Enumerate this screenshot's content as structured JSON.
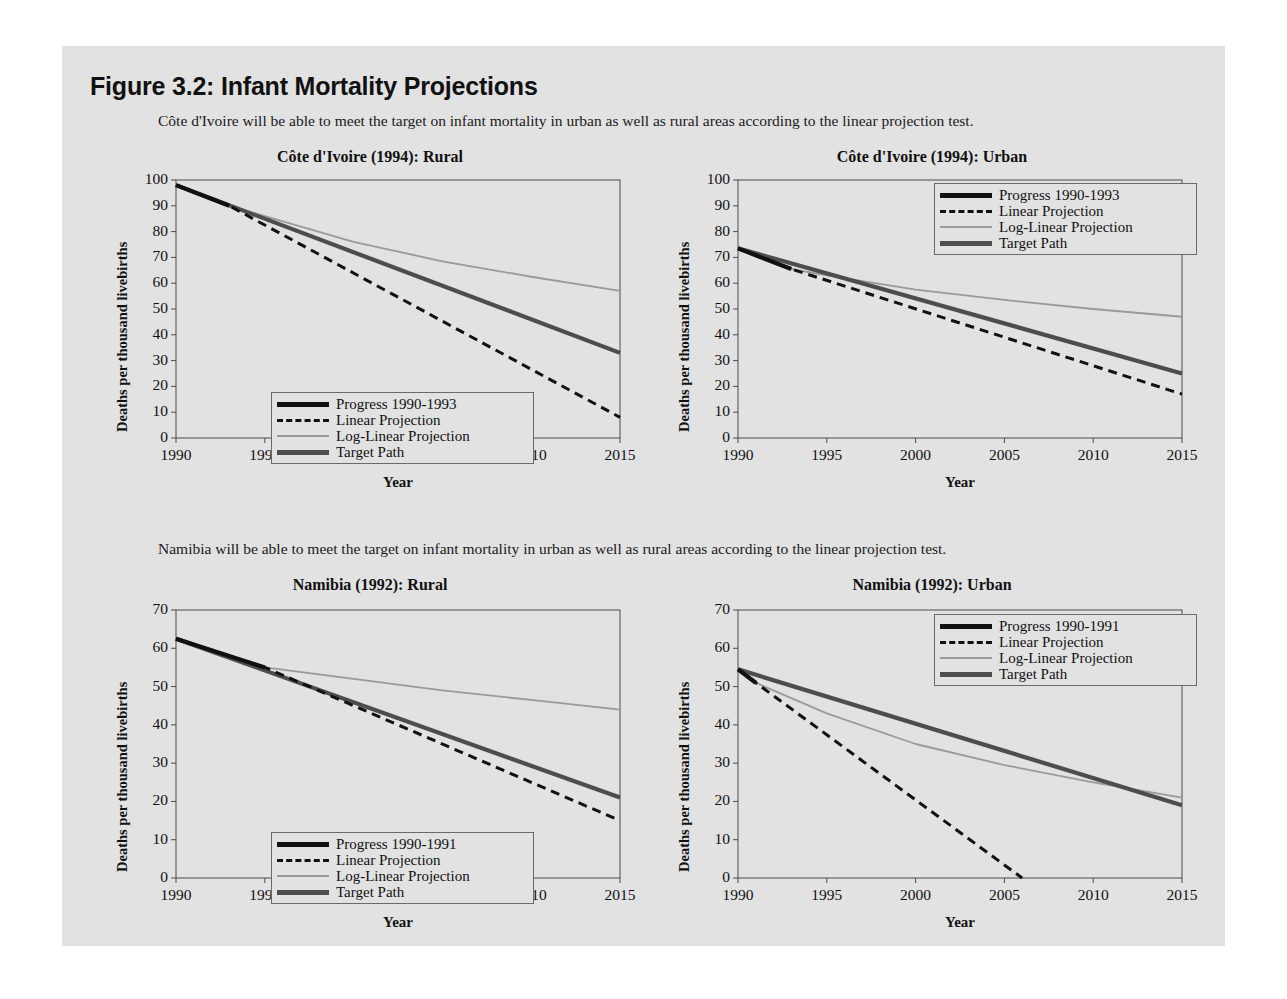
{
  "figure": {
    "title": "Figure 3.2: Infant Mortality Projections",
    "caption_1": "Côte d'Ivoire will be able to meet the target on infant mortality in urban as well as rural areas according to the linear projection test.",
    "caption_2": "Namibia will be able to meet the target on infant mortality in urban as well as rural areas according to the linear projection test."
  },
  "colors": {
    "page_background": "#e2e2e2",
    "rule": "#2e2e2e",
    "progress": "#111111",
    "linear": "#111111",
    "log_linear": "#9a9a9a",
    "target": "#4d4d4d",
    "axis": "#4a4a4a"
  },
  "chart_data": [
    {
      "id": "cote-divoire-rural",
      "type": "line",
      "title": "Côte d'Ivoire (1994):  Rural",
      "xlabel": "Year",
      "ylabel": "Deaths per thousand livebirths",
      "xlim": [
        1990,
        2015
      ],
      "ylim": [
        0,
        100
      ],
      "xticks": [
        1990,
        1995,
        2000,
        2005,
        2010,
        2015
      ],
      "yticks": [
        0,
        10,
        20,
        30,
        40,
        50,
        60,
        70,
        80,
        90,
        100
      ],
      "grid": false,
      "legend_position": "bottom-left",
      "series": [
        {
          "name": "Progress 1990-1993",
          "style": "thick-black",
          "x": [
            1990,
            1993
          ],
          "y": [
            98,
            90
          ]
        },
        {
          "name": "Linear Projection",
          "style": "dashed-black",
          "x": [
            1990,
            1993,
            2015
          ],
          "y": [
            98,
            90,
            8
          ]
        },
        {
          "name": "Log-Linear Projection",
          "style": "thin-gray",
          "x": [
            1990,
            1993,
            1995,
            2000,
            2005,
            2010,
            2015
          ],
          "y": [
            98,
            90,
            86,
            76,
            68.5,
            62.5,
            57
          ]
        },
        {
          "name": "Target Path",
          "style": "thick-gray",
          "x": [
            1990,
            2015
          ],
          "y": [
            98,
            33
          ]
        }
      ]
    },
    {
      "id": "cote-divoire-urban",
      "type": "line",
      "title": "Côte d'Ivoire (1994): Urban",
      "xlabel": "Year",
      "ylabel": "Deaths per thousand livebirths",
      "xlim": [
        1990,
        2015
      ],
      "ylim": [
        0,
        100
      ],
      "xticks": [
        1990,
        1995,
        2000,
        2005,
        2010,
        2015
      ],
      "yticks": [
        0,
        10,
        20,
        30,
        40,
        50,
        60,
        70,
        80,
        90,
        100
      ],
      "grid": false,
      "legend_position": "top-right",
      "series": [
        {
          "name": "Progress 1990-1993",
          "style": "thick-black",
          "x": [
            1990,
            1993
          ],
          "y": [
            73.5,
            65.5
          ]
        },
        {
          "name": "Linear Projection",
          "style": "dashed-black",
          "x": [
            1990,
            1993,
            2015
          ],
          "y": [
            73.5,
            65.5,
            17
          ]
        },
        {
          "name": "Log-Linear Projection",
          "style": "thin-gray",
          "x": [
            1990,
            1993,
            1995,
            2000,
            2005,
            2010,
            2015
          ],
          "y": [
            73.5,
            65.5,
            63,
            57.5,
            53.5,
            50,
            47
          ]
        },
        {
          "name": "Target Path",
          "style": "thick-gray",
          "x": [
            1990,
            2015
          ],
          "y": [
            73.5,
            25
          ]
        }
      ]
    },
    {
      "id": "namibia-rural",
      "type": "line",
      "title": "Namibia (1992): Rural",
      "xlabel": "Year",
      "ylabel": "Deaths per thousand livebirths",
      "xlim": [
        1990,
        2015
      ],
      "ylim": [
        0,
        70
      ],
      "xticks": [
        1990,
        1995,
        2000,
        2005,
        2010,
        2015
      ],
      "yticks": [
        0,
        10,
        20,
        30,
        40,
        50,
        60,
        70
      ],
      "grid": false,
      "legend_position": "bottom-left",
      "series": [
        {
          "name": "Progress 1990-1991",
          "style": "thick-black",
          "x": [
            1990,
            1995
          ],
          "y": [
            62.5,
            55
          ]
        },
        {
          "name": "Linear Projection",
          "style": "dashed-black",
          "x": [
            1990,
            1995,
            2015
          ],
          "y": [
            62.5,
            55,
            15
          ]
        },
        {
          "name": "Log-Linear Projection",
          "style": "thin-gray",
          "x": [
            1990,
            1995,
            2000,
            2005,
            2010,
            2015
          ],
          "y": [
            62.5,
            55,
            52,
            49,
            46.5,
            44
          ]
        },
        {
          "name": "Target Path",
          "style": "thick-gray",
          "x": [
            1990,
            2015
          ],
          "y": [
            62.5,
            21
          ]
        }
      ]
    },
    {
      "id": "namibia-urban",
      "type": "line",
      "title": "Namibia (1992): Urban",
      "xlabel": "Year",
      "ylabel": "Deaths per thousand livebirths",
      "xlim": [
        1990,
        2015
      ],
      "ylim": [
        0,
        70
      ],
      "xticks": [
        1990,
        1995,
        2000,
        2005,
        2010,
        2015
      ],
      "yticks": [
        0,
        10,
        20,
        30,
        40,
        50,
        60,
        70
      ],
      "grid": false,
      "legend_position": "top-right",
      "series": [
        {
          "name": "Progress 1990-1991",
          "style": "thick-black",
          "x": [
            1990,
            1991
          ],
          "y": [
            54.5,
            51
          ]
        },
        {
          "name": "Linear Projection",
          "style": "dashed-black",
          "x": [
            1990,
            1991,
            2006
          ],
          "y": [
            54.5,
            51,
            0
          ]
        },
        {
          "name": "Log-Linear Projection",
          "style": "thin-gray",
          "x": [
            1990,
            1991,
            1995,
            2000,
            2005,
            2010,
            2015
          ],
          "y": [
            54.5,
            51,
            43,
            35,
            29.5,
            25,
            21
          ]
        },
        {
          "name": "Target Path",
          "style": "thick-gray",
          "x": [
            1990,
            2015
          ],
          "y": [
            54.5,
            19
          ]
        }
      ]
    }
  ]
}
